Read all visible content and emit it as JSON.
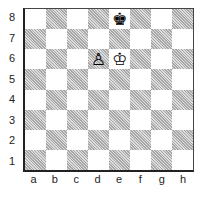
{
  "diagram": {
    "type": "chess-position",
    "files": [
      "a",
      "b",
      "c",
      "d",
      "e",
      "f",
      "g",
      "h"
    ],
    "ranks": [
      "8",
      "7",
      "6",
      "5",
      "4",
      "3",
      "2",
      "1"
    ],
    "pieces": [
      {
        "square": "e8",
        "piece": "black-king",
        "glyph": "♚"
      },
      {
        "square": "d6",
        "piece": "white-pawn",
        "glyph": "♙"
      },
      {
        "square": "e6",
        "piece": "white-king",
        "glyph": "♔"
      }
    ],
    "colors": {
      "light": "#ffffff",
      "dark": "#c0c0c0",
      "border": "#222222"
    }
  }
}
